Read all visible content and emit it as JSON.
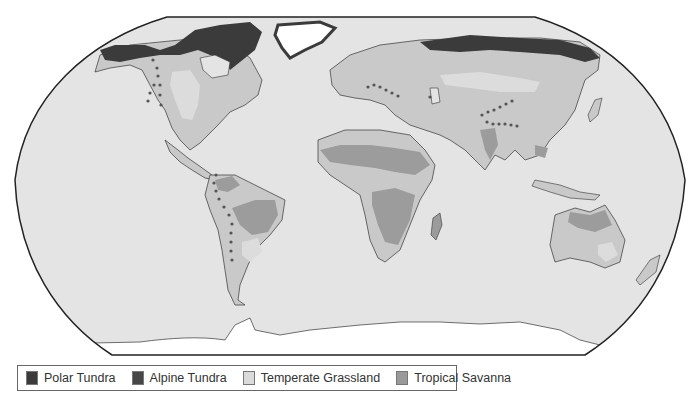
{
  "map": {
    "projection": "Robinson",
    "colors": {
      "ocean": "#e4e4e4",
      "land_default": "#c9c9c9",
      "ice": "#ffffff",
      "polar_tundra": "#3b3b3b",
      "alpine_tundra": "#4a4a4a",
      "temperate_grassland": "#dcdcdc",
      "tropical_savanna": "#9c9c9c",
      "outline": "#222222"
    }
  },
  "legend": {
    "items": [
      {
        "key": "polar_tundra",
        "label": "Polar Tundra",
        "color": "#3b3b3b"
      },
      {
        "key": "alpine_tundra",
        "label": "Alpine Tundra",
        "color": "#474747"
      },
      {
        "key": "temperate_grassland",
        "label": "Temperate Grassland",
        "color": "#dadada"
      },
      {
        "key": "tropical_savanna",
        "label": "Tropical Savanna",
        "color": "#9a9a9a"
      }
    ]
  }
}
